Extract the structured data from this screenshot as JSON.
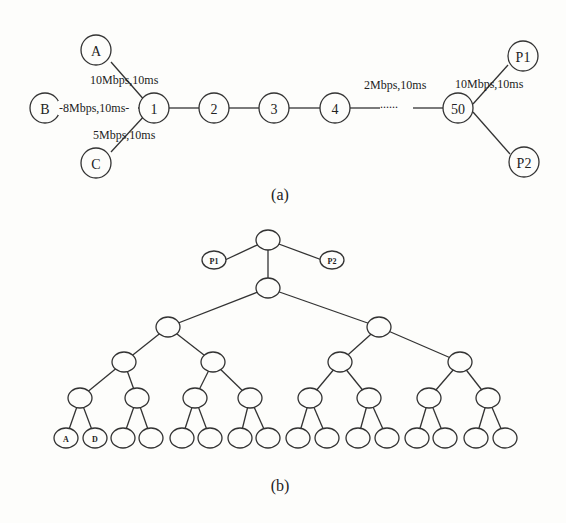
{
  "figure_a": {
    "caption": "(a)",
    "nodes": {
      "A": "A",
      "B": "B",
      "C": "C",
      "n1": "1",
      "n2": "2",
      "n3": "3",
      "n4": "4",
      "n50": "50",
      "P1": "P1",
      "P2": "P2"
    },
    "links": {
      "A_1": "10Mbps,10ms",
      "B_1": "-8Mbps,10ms-",
      "C_1": "5Mbps,10ms",
      "chain": "2Mbps,10ms",
      "chain_gap": "......",
      "50_P": "10Mbps,10ms"
    }
  },
  "figure_b": {
    "caption": "(b)",
    "nodes": {
      "P1": "P1",
      "P2": "P2",
      "leaf1": "A",
      "leaf2": "D"
    }
  }
}
